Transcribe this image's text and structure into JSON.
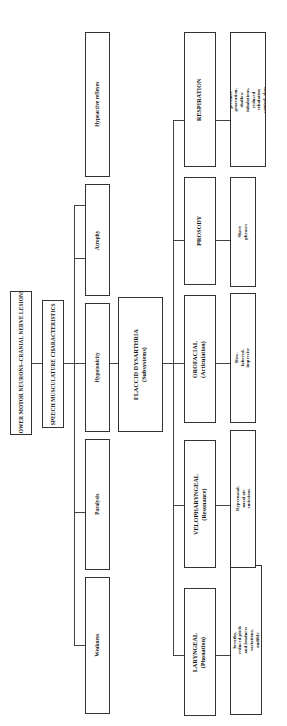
{
  "diagram": {
    "orientation": "rotated-90-ccw",
    "root": {
      "label": "LOWER MOTOR NEURONS–CRANIAL NERVE LESIONS"
    },
    "level2": {
      "label": "SPEECH MUSCULATURE CHARACTERISTICS"
    },
    "characteristics": [
      {
        "label": "Weakness"
      },
      {
        "label": "Paralysis"
      },
      {
        "label": "Hypotonicity"
      },
      {
        "label": "Atrophy"
      },
      {
        "label": "Hypoactive reflexes"
      }
    ],
    "dysarthria": {
      "label": "FLACCID DYSARTHRIA",
      "sublabel": "(Subsystems)"
    },
    "subsystems": [
      {
        "label": "LARYNGEAL",
        "sublabel": "(Phonation)",
        "descriptor": "Hoarse-breathy, reduced pitch and loudness variations, audible inspirations"
      },
      {
        "label": "VELOPHARYNGEAL",
        "sublabel": "(Resonance)",
        "descriptor": "Hypernasal, nasal air emissions"
      },
      {
        "label": "OROFACIAL",
        "sublabel": "(Articulation)",
        "descriptor": "Slow-labored, imprecise"
      },
      {
        "label": "PROSODY",
        "sublabel": "",
        "descriptor": "Short phrases"
      },
      {
        "label": "RESPIRATION",
        "sublabel": "",
        "descriptor": "Reduced pressure generation, shallow inhalations, reduced exhalation control, slow breaths"
      }
    ],
    "colors": {
      "border": "#333333",
      "text": "#111111",
      "background": "#ffffff"
    }
  }
}
